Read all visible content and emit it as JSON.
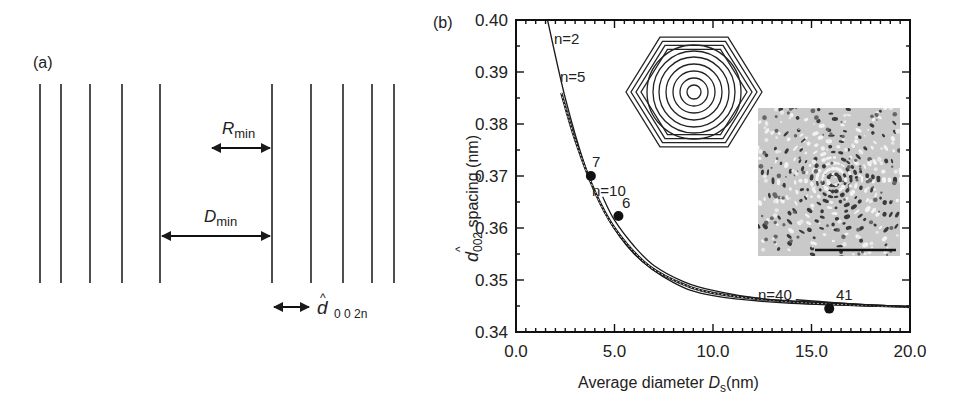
{
  "panel_a": {
    "label": "(a)",
    "r_min_label": "R",
    "r_min_sub": "min",
    "d_min_label": "D",
    "d_min_sub": "min",
    "d_label": "d",
    "d_hat": "^",
    "d_sub": "0 0 2n",
    "lines_x": [
      40,
      61,
      90,
      122,
      160,
      272,
      311,
      343,
      372,
      394
    ]
  },
  "panel_b": {
    "label": "(b)",
    "annotations": [
      "n=2",
      "n=5",
      "n=10",
      "n=40",
      "7",
      "6",
      "41"
    ],
    "ylabel_d": "d",
    "ylabel_sub": "002",
    "ylabel_rest": " spacing (nm)",
    "xlabel_main": "Average diameter ",
    "xlabel_d": "D",
    "xlabel_sub": "s",
    "xlabel_unit": "(nm)"
  },
  "chart_data": {
    "type": "line",
    "title": "",
    "xlabel": "Average diameter Ds (nm)",
    "ylabel": "d002 spacing (nm)",
    "xlim": [
      0.0,
      20.0
    ],
    "ylim": [
      0.34,
      0.4
    ],
    "xticks": [
      "0.0",
      "5.0",
      "10.0",
      "15.0",
      "20.0"
    ],
    "yticks": [
      "0.34",
      "0.35",
      "0.36",
      "0.37",
      "0.38",
      "0.39",
      "0.40"
    ],
    "grid": false,
    "series": [
      {
        "name": "n=2",
        "x": [
          1.6,
          2.5,
          3.5,
          4.5,
          6,
          8,
          10,
          14,
          20
        ],
        "y": [
          0.4,
          0.385,
          0.372,
          0.363,
          0.355,
          0.3495,
          0.347,
          0.3455,
          0.3448
        ]
      },
      {
        "name": "n=5",
        "x": [
          2.3,
          3,
          4,
          5,
          6.5,
          8,
          10,
          14,
          20
        ],
        "y": [
          0.386,
          0.377,
          0.367,
          0.36,
          0.3535,
          0.35,
          0.3475,
          0.3458,
          0.3448
        ]
      },
      {
        "name": "n=10",
        "x": [
          4.4,
          5,
          6,
          7,
          8.5,
          10,
          13,
          20
        ],
        "y": [
          0.366,
          0.3615,
          0.3565,
          0.3528,
          0.3497,
          0.348,
          0.3462,
          0.3449
        ]
      },
      {
        "name": "n=40",
        "x": [
          14.2,
          16,
          18,
          20
        ],
        "y": [
          0.3462,
          0.3457,
          0.3452,
          0.3449
        ]
      }
    ],
    "points": [
      {
        "label": "7",
        "x": 3.8,
        "y": 0.37
      },
      {
        "label": "6",
        "x": 5.2,
        "y": 0.3623
      },
      {
        "label": "41",
        "x": 15.9,
        "y": 0.3445
      }
    ],
    "insets": [
      "hexagonal concentric-shell schematic",
      "TEM image of onion-like particle with scale bar"
    ]
  }
}
